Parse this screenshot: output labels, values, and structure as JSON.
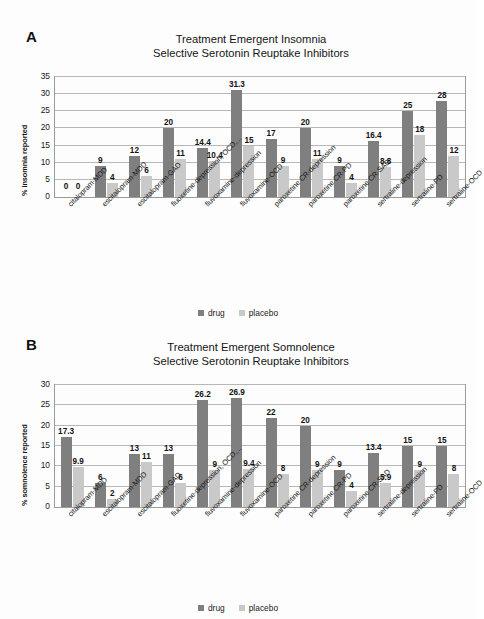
{
  "legend": {
    "drug_label": "drug",
    "placebo_label": "placebo"
  },
  "panels": [
    {
      "letter": "A",
      "title_line1": "Treatment Emergent Insomnia",
      "title_line2": "Selective Serotonin Reuptake Inhibitors"
    },
    {
      "letter": "B",
      "title_line1": "Treatment Emergent Somnolence",
      "title_line2": "Selective Serotonin Reuptake Inhibitors"
    }
  ],
  "colors": {
    "drug": "#7f7f7f",
    "placebo": "#c9c9c9",
    "axis": "#9b9b9b",
    "grid": "#b8b8b8"
  },
  "chart_data": [
    {
      "type": "bar",
      "title": "Treatment Emergent Insomnia Selective Serotonin Reuptake Inhibitors",
      "panel": "A",
      "xlabel": "",
      "ylabel": "% insomnia reported",
      "ylim": [
        0,
        35
      ],
      "yticks": [
        0,
        5,
        10,
        15,
        20,
        25,
        30,
        35
      ],
      "grid": true,
      "legend_position": "bottom",
      "categories": [
        "citalopram-MDD",
        "escitalopram-MDD",
        "escitalopram-GAD",
        "fluoxetine-depression, OCD,...",
        "fluvoxamine-depression",
        "fluvoxamine-OCD",
        "paroxetine CR-depression",
        "paroxetine CR-PD",
        "paroxetine CR-SAD",
        "sertraline-depression",
        "sertraline-PD",
        "sertraline-OCD"
      ],
      "series": [
        {
          "name": "drug",
          "values": [
            0,
            9,
            12,
            20,
            14.4,
            31.3,
            17,
            20,
            9,
            16.4,
            25,
            28
          ],
          "labels": [
            "0",
            "9",
            "12",
            "20",
            "14.4",
            "31.3",
            "17",
            "20",
            "9",
            "16.4",
            "25",
            "28"
          ]
        },
        {
          "name": "placebo",
          "values": [
            0,
            4,
            6,
            11,
            10.4,
            15,
            9,
            11,
            4,
            8.8,
            18,
            12
          ],
          "labels": [
            "0",
            "4",
            "6",
            "11",
            "10.4",
            "15",
            "9",
            "11",
            "4",
            "8.8",
            "18",
            "12"
          ]
        }
      ]
    },
    {
      "type": "bar",
      "title": "Treatment Emergent Somnolence Selective Serotonin Reuptake Inhibitors",
      "panel": "B",
      "xlabel": "",
      "ylabel": "% somnolence reported",
      "ylim": [
        0,
        30
      ],
      "yticks": [
        0,
        5,
        10,
        15,
        20,
        25,
        30
      ],
      "grid": true,
      "legend_position": "bottom",
      "categories": [
        "citalopram-MDD",
        "escitalopram-MDD",
        "escitalopram-GAD",
        "fluoxetine-depression, OCD,...",
        "fluvoxamine-depression",
        "fluvoxamine-OCD",
        "paroxetine CR-depression",
        "paroxetine CR-PD",
        "paroxetine CR-SAD",
        "sertraline-depression",
        "sertraline-PD",
        "sertraline-OCD"
      ],
      "series": [
        {
          "name": "drug",
          "values": [
            17.3,
            6,
            13,
            13,
            26.2,
            26.9,
            22,
            20,
            9,
            13.4,
            15,
            15
          ],
          "labels": [
            "17.3",
            "6",
            "13",
            "13",
            "26.2",
            "26.9",
            "22",
            "20",
            "9",
            "13.4",
            "15",
            "15"
          ]
        },
        {
          "name": "placebo",
          "values": [
            9.9,
            2,
            11,
            6,
            9,
            9.4,
            8,
            9,
            4,
            5.9,
            9,
            8
          ],
          "labels": [
            "9.9",
            "2",
            "11",
            "6",
            "9",
            "9.4",
            "8",
            "9",
            "4",
            "5.9",
            "9",
            "8"
          ]
        }
      ]
    }
  ]
}
